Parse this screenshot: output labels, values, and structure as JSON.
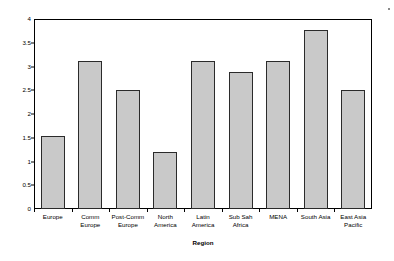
{
  "chart_data": {
    "type": "bar",
    "title": "",
    "xlabel": "Region",
    "ylabel": "Mean Torture Scale (Hathaway)",
    "categories": [
      "Europe",
      "Comm Europe",
      "Post-Comm Europe",
      "North America",
      "Latin America",
      "Sub Sah Africa",
      "MENA",
      "South Asia",
      "East Asia Pacific"
    ],
    "category_lines": [
      [
        "Europe"
      ],
      [
        "Comm",
        "Europe"
      ],
      [
        "Post-Comm",
        "Europe"
      ],
      [
        "North",
        "America"
      ],
      [
        "Latin",
        "America"
      ],
      [
        "Sub Sah",
        "Africa"
      ],
      [
        "MENA"
      ],
      [
        "South Asia"
      ],
      [
        "East Asia",
        "Pacific"
      ]
    ],
    "values": [
      1.53,
      3.11,
      2.51,
      1.2,
      3.12,
      2.89,
      3.11,
      3.77,
      2.5
    ],
    "ylim": [
      0,
      4
    ],
    "yticks": [
      0,
      0.5,
      1,
      1.5,
      2,
      2.5,
      3,
      3.5,
      4
    ],
    "ytick_labels": [
      "0",
      "0.5",
      "1",
      "1.5",
      "2",
      "2.5",
      "3",
      "3.5",
      "4"
    ],
    "grid": false,
    "legend": null,
    "bar_color": "#c9c9c9",
    "bar_edge_color": "#2b2b2b",
    "frame_color": "#000000"
  }
}
